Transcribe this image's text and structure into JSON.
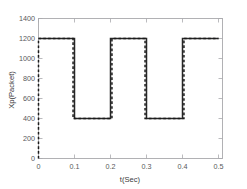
{
  "chart_data": {
    "type": "line",
    "title": "",
    "subtitle": "",
    "xlabel": "t(Sec)",
    "ylabel": "Xp(Packet)",
    "xlim": [
      0,
      0.5
    ],
    "ylim": [
      0,
      1400
    ],
    "xticks": [
      0,
      0.1,
      0.2,
      0.3,
      0.4,
      0.5
    ],
    "xtick_labels": [
      "0",
      "0.1",
      "0.2",
      "0.3",
      "0.4",
      "0.5"
    ],
    "yticks": [
      0,
      200,
      400,
      600,
      800,
      1000,
      1200,
      1400
    ],
    "ytick_labels": [
      "0",
      "200",
      "400",
      "600",
      "800",
      "1000",
      "1200",
      "1400"
    ],
    "grid": false,
    "legend": null,
    "legend_position": "none",
    "high_level": 1200,
    "low_level": 400,
    "period": 0.2,
    "duty_cycle": 0.5,
    "series": [
      {
        "name": "solid-trace",
        "style": "solid",
        "color": "#262626",
        "x": [
          0,
          0.1,
          0.1,
          0.2,
          0.2,
          0.3,
          0.3,
          0.4,
          0.4,
          0.5
        ],
        "y": [
          1200,
          1200,
          400,
          400,
          1200,
          1200,
          400,
          400,
          1200,
          1200
        ]
      },
      {
        "name": "dashed-trace",
        "style": "dashed",
        "color": "#1a1a1a",
        "x": [
          0,
          0,
          0.096,
          0.096,
          0.204,
          0.204,
          0.296,
          0.296,
          0.404,
          0.404,
          0.5
        ],
        "y": [
          0,
          1200,
          1200,
          400,
          400,
          1200,
          1200,
          400,
          400,
          1200,
          1200
        ]
      }
    ]
  }
}
